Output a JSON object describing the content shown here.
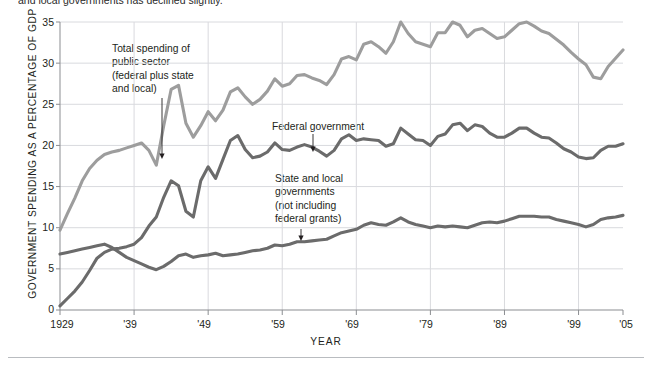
{
  "figure": {
    "caption_partial": "and local governments has declined slightly.",
    "axis": {
      "ylabel": "GOVERNMENT SPENDING AS A PERCENTAGE OF GDP",
      "xlabel": "YEAR",
      "yticks": [
        "0",
        "5",
        "10",
        "15",
        "20",
        "25",
        "30",
        "35"
      ],
      "xticks": [
        "1929",
        "'39",
        "'49",
        "'59",
        "'69",
        "'79",
        "'89",
        "'99",
        "'05"
      ]
    },
    "annotations": [
      {
        "name": "total-spending-label",
        "lines": [
          "Total spending of",
          "public sector",
          "(federal plus state",
          "and local)"
        ]
      },
      {
        "name": "federal-government-label",
        "lines": [
          "Federal government"
        ]
      },
      {
        "name": "state-local-label",
        "lines": [
          "State and local",
          "governments",
          "(not including",
          "federal grants)"
        ]
      }
    ],
    "colors": {
      "total_line": "#9d9d9d",
      "federal_line": "#6b6b6b",
      "state_local_line": "#6b6b6b",
      "grid": "#d9dade",
      "axis": "#8b8d91",
      "text": "#231f20",
      "background": "#ffffff"
    }
  },
  "chart_data": {
    "type": "line",
    "title": "",
    "xlabel": "YEAR",
    "ylabel": "GOVERNMENT SPENDING AS A PERCENTAGE OF GDP",
    "xlim": [
      1929,
      2005
    ],
    "ylim": [
      0,
      35
    ],
    "grid": true,
    "legend": "inline annotations",
    "x": [
      1929,
      1930,
      1931,
      1932,
      1933,
      1934,
      1935,
      1936,
      1937,
      1938,
      1939,
      1940,
      1941,
      1942,
      1943,
      1944,
      1945,
      1946,
      1947,
      1948,
      1949,
      1950,
      1951,
      1952,
      1953,
      1954,
      1955,
      1956,
      1957,
      1958,
      1959,
      1960,
      1961,
      1962,
      1963,
      1964,
      1965,
      1966,
      1967,
      1968,
      1969,
      1970,
      1971,
      1972,
      1973,
      1974,
      1975,
      1976,
      1977,
      1978,
      1979,
      1980,
      1981,
      1982,
      1983,
      1984,
      1985,
      1986,
      1987,
      1988,
      1989,
      1990,
      1991,
      1992,
      1993,
      1994,
      1995,
      1996,
      1997,
      1998,
      1999,
      2000,
      2001,
      2002,
      2003,
      2004,
      2005
    ],
    "series": [
      {
        "name": "Total spending of public sector (federal plus state and local)",
        "color": "#9d9d9d",
        "values": [
          9.7,
          11.7,
          13.6,
          15.7,
          17.2,
          18.2,
          18.9,
          19.2,
          19.4,
          19.7,
          20.0,
          20.3,
          19.4,
          17.6,
          22.4,
          26.8,
          27.3,
          22.7,
          21.0,
          22.4,
          24.1,
          23.0,
          24.3,
          26.5,
          27.0,
          25.9,
          25.0,
          25.6,
          26.6,
          28.1,
          27.2,
          27.5,
          28.5,
          28.6,
          28.2,
          27.9,
          27.4,
          28.6,
          30.5,
          30.8,
          30.4,
          32.3,
          32.6,
          32.0,
          31.2,
          32.6,
          35.0,
          33.6,
          32.6,
          32.3,
          32.0,
          33.7,
          33.7,
          35.0,
          34.6,
          33.2,
          34.0,
          34.2,
          33.6,
          33.0,
          33.2,
          34.0,
          34.8,
          35.0,
          34.5,
          33.9,
          33.6,
          32.9,
          32.2,
          31.3,
          30.5,
          29.8,
          28.3,
          28.1,
          29.6,
          30.6,
          31.6
        ]
      },
      {
        "name": "Federal government",
        "color": "#6b6b6b",
        "values": [
          0.5,
          1.4,
          2.3,
          3.4,
          4.8,
          6.3,
          7.0,
          7.4,
          7.5,
          7.7,
          8.0,
          8.8,
          10.2,
          11.3,
          13.7,
          15.7,
          15.1,
          12.0,
          11.3,
          15.7,
          17.4,
          16.0,
          18.3,
          20.6,
          21.2,
          19.5,
          18.5,
          18.7,
          19.2,
          20.3,
          19.5,
          19.4,
          19.8,
          20.1,
          19.8,
          19.3,
          18.7,
          19.4,
          20.8,
          21.3,
          20.6,
          20.8,
          20.7,
          20.6,
          19.9,
          20.2,
          22.1,
          21.4,
          20.7,
          20.6,
          20.0,
          21.1,
          21.4,
          22.5,
          22.7,
          21.8,
          22.5,
          22.3,
          21.5,
          21.0,
          21.0,
          21.5,
          22.1,
          22.1,
          21.5,
          21.0,
          20.9,
          20.3,
          19.6,
          19.2,
          18.6,
          18.4,
          18.5,
          19.4,
          19.9,
          19.9,
          20.2
        ]
      },
      {
        "name": "State and local governments (not including federal grants)",
        "color": "#6b6b6b",
        "values": [
          6.8,
          7.0,
          7.2,
          7.4,
          7.6,
          7.8,
          8.0,
          7.6,
          7.0,
          6.4,
          6.0,
          5.6,
          5.2,
          4.9,
          5.3,
          5.9,
          6.6,
          6.8,
          6.4,
          6.6,
          6.7,
          6.9,
          6.6,
          6.7,
          6.8,
          7.0,
          7.2,
          7.3,
          7.5,
          7.9,
          7.8,
          8.0,
          8.3,
          8.3,
          8.4,
          8.5,
          8.6,
          9.0,
          9.4,
          9.6,
          9.8,
          10.3,
          10.6,
          10.4,
          10.3,
          10.7,
          11.2,
          10.7,
          10.4,
          10.2,
          10.0,
          10.2,
          10.1,
          10.2,
          10.1,
          10.0,
          10.3,
          10.6,
          10.7,
          10.6,
          10.8,
          11.1,
          11.4,
          11.4,
          11.4,
          11.3,
          11.3,
          11.0,
          10.8,
          10.6,
          10.4,
          10.1,
          10.4,
          11.0,
          11.2,
          11.3,
          11.5
        ]
      }
    ]
  }
}
